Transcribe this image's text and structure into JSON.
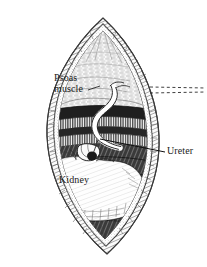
{
  "figure": {
    "kind": "anatomical-line-illustration",
    "style": "pen-and-ink hatched engraving",
    "background_color": "#ffffff",
    "ink_color": "#1a1a1a",
    "width": 207,
    "height": 267
  },
  "labels": {
    "psoas": {
      "text": "Psoas\nmuscle",
      "line1": "Psoas",
      "line2": "muscle",
      "x": 54,
      "y": 73
    },
    "ureter": {
      "text": "Ureter",
      "x": 167,
      "y": 146
    },
    "kidney": {
      "text": "Kidney",
      "x": 59,
      "y": 175
    }
  },
  "leader_lines": [
    {
      "name": "psoas-leader",
      "style": "dashed",
      "from_x": 96,
      "from_y": 84,
      "to_x": 205,
      "to_y": 89
    },
    {
      "name": "psoas-leader-second",
      "style": "dashed",
      "from_x": 140,
      "from_y": 93,
      "to_x": 205,
      "to_y": 92
    },
    {
      "name": "ureter-leader",
      "style": "solid",
      "from_x": 100,
      "from_y": 140,
      "to_x": 164,
      "to_y": 152
    }
  ],
  "structures": [
    {
      "name": "wound-opening",
      "description": "lens-shaped flank incision retracted open"
    },
    {
      "name": "skin-edge",
      "description": "stippled outer skin and subcutaneous fat margin"
    },
    {
      "name": "psoas-muscle",
      "description": "pale striated muscle mass at upper field"
    },
    {
      "name": "muscle-fiber-bands",
      "description": "horizontal comb-hatched muscle layers"
    },
    {
      "name": "perirenal-fat",
      "description": "dark cross-hatched retroperitoneal tissue"
    },
    {
      "name": "kidney",
      "description": "large pale bean-shaped organ, lower field"
    },
    {
      "name": "ureter",
      "description": "white tubular structure curving from upper field into renal hilum"
    },
    {
      "name": "renal-hilum",
      "description": "vessel and pelvis cluster at kidney medial border"
    }
  ]
}
